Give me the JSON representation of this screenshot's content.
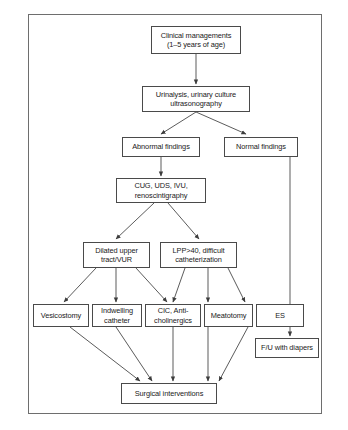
{
  "figure": {
    "type": "flowchart",
    "frame": {
      "border_color": "#6e6e6e",
      "background": "#ffffff"
    },
    "node_border_color": "#4a4a4a",
    "edge_color": "#3d3d3d"
  },
  "nodes": {
    "clinical_managements": "Clinical managements\n(1–5 years of age)",
    "urinalysis": "Urinalysis, urinary culture\nultrasonography",
    "abnormal_findings": "Abnormal findings",
    "normal_findings": "Normal findings",
    "cug_uds_ivu": "CUG, UDS, IVU,\nrenoscintigraphy",
    "dilated_upper_tract": "Dilated upper\ntract/VUR",
    "lpp_difficult_cath": "LPP>40, difficult\ncatheterization",
    "vesicostomy": "Vesicostomy",
    "indwelling_catheter": "Indwelling\ncatheter",
    "cic_anticholinergics": "CIC, Anti-\ncholinergics",
    "meatotomy": "Meatotomy",
    "es": "ES",
    "fu_with_diapers": "F/U with diapers",
    "surgical_interventions": "Surgical interventions"
  },
  "edges": [
    {
      "from": "clinical_managements",
      "to": "urinalysis"
    },
    {
      "from": "urinalysis",
      "to": "abnormal_findings"
    },
    {
      "from": "urinalysis",
      "to": "normal_findings"
    },
    {
      "from": "abnormal_findings",
      "to": "cug_uds_ivu"
    },
    {
      "from": "cug_uds_ivu",
      "to": "dilated_upper_tract"
    },
    {
      "from": "cug_uds_ivu",
      "to": "lpp_difficult_cath"
    },
    {
      "from": "dilated_upper_tract",
      "to": "vesicostomy"
    },
    {
      "from": "dilated_upper_tract",
      "to": "indwelling_catheter"
    },
    {
      "from": "dilated_upper_tract",
      "to": "cic_anticholinergics"
    },
    {
      "from": "lpp_difficult_cath",
      "to": "cic_anticholinergics"
    },
    {
      "from": "lpp_difficult_cath",
      "to": "meatotomy"
    },
    {
      "from": "lpp_difficult_cath",
      "to": "es"
    },
    {
      "from": "normal_findings",
      "to": "fu_with_diapers"
    },
    {
      "from": "vesicostomy",
      "to": "surgical_interventions"
    },
    {
      "from": "indwelling_catheter",
      "to": "surgical_interventions"
    },
    {
      "from": "cic_anticholinergics",
      "to": "surgical_interventions"
    },
    {
      "from": "meatotomy",
      "to": "surgical_interventions"
    },
    {
      "from": "es",
      "to": "surgical_interventions"
    }
  ]
}
